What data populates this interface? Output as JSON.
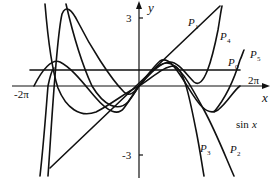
{
  "figure": {
    "axes": {
      "x_label": "x",
      "y_label": "y",
      "x_ticks": [
        "-2π",
        "2π"
      ],
      "y_ticks": [
        "3",
        "-3"
      ]
    },
    "curve_labels": {
      "p1": "P",
      "p1_sub": "1",
      "p4": "P",
      "p4_sub": "4",
      "p5": "P",
      "p5_sub": "5",
      "p0": "P",
      "p0_sub": "0",
      "p3": "P",
      "p3_sub": "3",
      "p2": "P",
      "p2_sub": "2",
      "sin": "sin",
      "sin_var": "x"
    },
    "colors": {
      "stroke": "#111111",
      "background": "#ffffff"
    }
  }
}
